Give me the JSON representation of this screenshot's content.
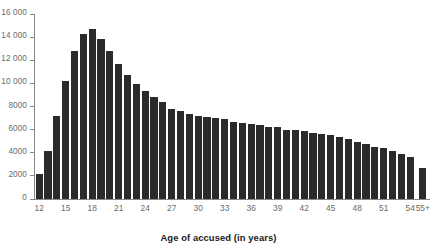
{
  "chart_data": {
    "type": "bar",
    "title": "",
    "subtitle": "",
    "xlabel": "Age of accused (in years)",
    "ylabel": "",
    "categories": [
      "12",
      "13",
      "14",
      "15",
      "16",
      "17",
      "18",
      "19",
      "20",
      "21",
      "22",
      "23",
      "24",
      "25",
      "26",
      "27",
      "28",
      "29",
      "30",
      "31",
      "32",
      "33",
      "34",
      "35",
      "36",
      "37",
      "38",
      "39",
      "40",
      "41",
      "42",
      "43",
      "44",
      "45",
      "46",
      "47",
      "48",
      "49",
      "50",
      "51",
      "52",
      "53",
      "54",
      "55+"
    ],
    "values": [
      2200,
      4150,
      7200,
      10200,
      12800,
      14300,
      14700,
      13850,
      12800,
      11700,
      10700,
      9950,
      9300,
      8800,
      8350,
      7750,
      7600,
      7350,
      7200,
      7050,
      7000,
      6950,
      6700,
      6600,
      6500,
      6400,
      6250,
      6200,
      6000,
      5950,
      5900,
      5700,
      5600,
      5500,
      5400,
      5150,
      4900,
      4800,
      4500,
      4400,
      4150,
      3900,
      3650,
      2700
    ],
    "x_tick_labels": [
      "12",
      "15",
      "18",
      "21",
      "24",
      "27",
      "30",
      "33",
      "36",
      "39",
      "42",
      "45",
      "48",
      "51",
      "54",
      "55+"
    ],
    "y_tick_labels": [
      "0",
      "2000",
      "4000",
      "6000",
      "8000",
      "10 000",
      "12 000",
      "14 000",
      "16 000"
    ],
    "y_tick_values": [
      0,
      2000,
      4000,
      6000,
      8000,
      10000,
      12000,
      14000,
      16000
    ],
    "ylim": [
      0,
      16000
    ],
    "grid": false,
    "legend": null,
    "bar_color": "#2b2b2b",
    "axis_color": "#8a8a8a",
    "label_color": "#6b6b6b",
    "title_color": "#1b1b1b"
  }
}
